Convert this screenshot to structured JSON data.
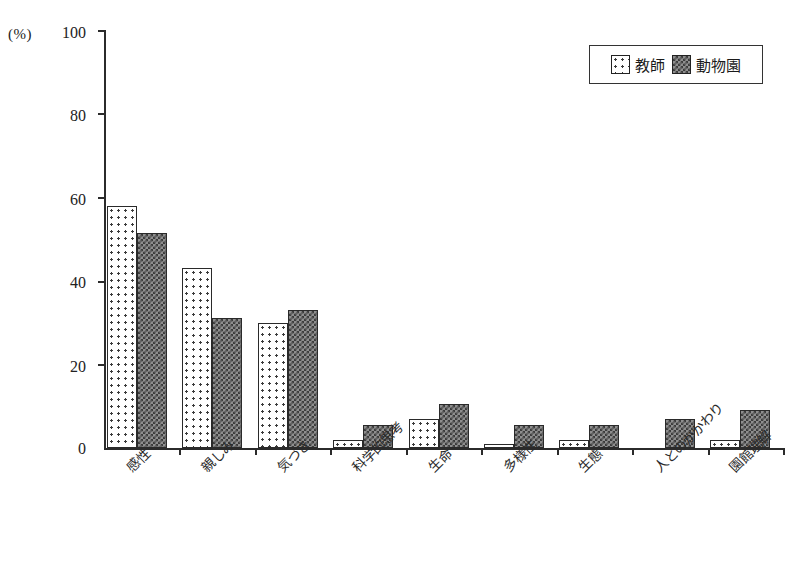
{
  "chart_data": {
    "type": "bar",
    "title": "",
    "subtitle": "",
    "xlabel": "",
    "ylabel": "(%)",
    "unit_label": "(%)",
    "ylim": [
      0,
      100
    ],
    "yticks": [
      0,
      20,
      40,
      60,
      80,
      100
    ],
    "ytick_labels": [
      "0",
      "20",
      "40",
      "60",
      "80",
      "100"
    ],
    "grid": false,
    "legend_position": "top-right",
    "categories": [
      "感性",
      "親しみ",
      "気づき",
      "科学的思考",
      "生命",
      "多様性",
      "生態",
      "人とのかかわり",
      "園館理解"
    ],
    "series": [
      {
        "name": "教師",
        "pattern": "dotted-light",
        "color": "#ffffff",
        "values": [
          58,
          43,
          30,
          2,
          7,
          1,
          2,
          0,
          2
        ]
      },
      {
        "name": "動物園",
        "pattern": "crosshatch-dark",
        "color": "#8e8e8e",
        "values": [
          51.5,
          31,
          33,
          5.5,
          10.5,
          5.5,
          5.5,
          7,
          9
        ]
      }
    ]
  },
  "legend": {
    "items": [
      {
        "label": "教師",
        "pattern": "dotted-light"
      },
      {
        "label": "動物園",
        "pattern": "crosshatch-dark"
      }
    ]
  },
  "axes": {
    "y_unit": "(%)",
    "y_tick_labels": [
      "100",
      "80",
      "60",
      "40",
      "20",
      "0"
    ]
  },
  "colors": {
    "axis": "#2b2b2b",
    "series_a_fill": "#ffffff",
    "series_b_fill": "#8e8e8e",
    "outline": "#2a2a2a",
    "background": "#ffffff"
  }
}
